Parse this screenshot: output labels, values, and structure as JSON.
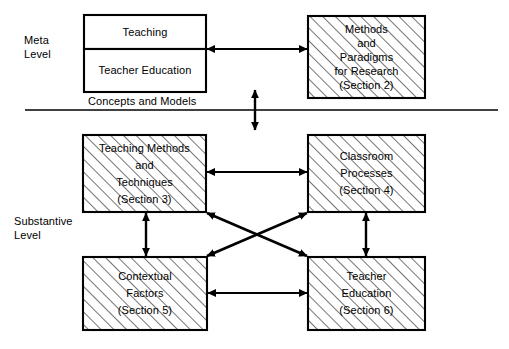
{
  "figure": {
    "levels": {
      "meta": {
        "line1": "Meta",
        "line2": "Level"
      },
      "substantive": {
        "line1": "Substantive",
        "line2": "Level"
      }
    },
    "divider_caption": "Concepts and  Models",
    "boxes": [
      {
        "id": "teaching",
        "name": "teaching-box",
        "hatched": false,
        "lines": [
          "Teaching"
        ]
      },
      {
        "id": "teacher-education-meta",
        "name": "teacher-education-meta-box",
        "hatched": false,
        "lines": [
          "Teacher  Education"
        ]
      },
      {
        "id": "methods-paradigms",
        "name": "methods-and-paradigms-box",
        "hatched": true,
        "lines": [
          "Methods",
          "and",
          "Paradigms",
          "for  Research",
          "(Section 2)"
        ]
      },
      {
        "id": "teaching-methods",
        "name": "teaching-methods-box",
        "hatched": true,
        "lines": [
          "Teaching Methods",
          "and",
          "Techniques",
          "(Section 3)"
        ]
      },
      {
        "id": "classroom-processes",
        "name": "classroom-processes-box",
        "hatched": true,
        "lines": [
          "Classroom",
          "Processes",
          "(Section 4)"
        ]
      },
      {
        "id": "contextual-factors",
        "name": "contextual-factors-box",
        "hatched": true,
        "lines": [
          "Contextual",
          "Factors",
          "(Section 5)"
        ]
      },
      {
        "id": "teacher-education-sub",
        "name": "teacher-education-substantive-box",
        "hatched": true,
        "lines": [
          "Teacher",
          "Education",
          "(Section 6)"
        ]
      }
    ],
    "connectors": [
      {
        "name": "meta-horizontal-arrow",
        "kind": "double-arrow",
        "orientation": "horizontal"
      },
      {
        "name": "level-crossing-arrow",
        "kind": "double-arrow",
        "orientation": "vertical"
      },
      {
        "name": "upper-substantive-horizontal-arrow",
        "kind": "double-arrow",
        "orientation": "horizontal"
      },
      {
        "name": "lower-substantive-horizontal-arrow",
        "kind": "double-arrow",
        "orientation": "horizontal"
      },
      {
        "name": "left-vertical-arrow",
        "kind": "double-arrow",
        "orientation": "vertical"
      },
      {
        "name": "right-vertical-arrow",
        "kind": "double-arrow",
        "orientation": "vertical"
      },
      {
        "name": "diagonal-arrow-methods-to-teacher-education",
        "kind": "double-arrow",
        "orientation": "diagonal"
      },
      {
        "name": "diagonal-arrow-contextual-to-classroom",
        "kind": "double-arrow",
        "orientation": "diagonal"
      }
    ],
    "colors": {
      "stroke": "#000000",
      "background": "#ffffff",
      "hatch": "#2b2b2b"
    }
  },
  "text": {
    "meta_level_1": "Meta",
    "meta_level_2": "Level",
    "substantive_level_1": "Substantive",
    "substantive_level_2": "Level",
    "concepts_and_models": "Concepts and  Models",
    "teaching": "Teaching",
    "teacher_education_meta": "Teacher  Education",
    "methods_l1": "Methods",
    "methods_l2": "and",
    "methods_l3": "Paradigms",
    "methods_l4": "for  Research",
    "methods_l5": "(Section 2)",
    "tm_l1": "Teaching Methods",
    "tm_l2": "and",
    "tm_l3": "Techniques",
    "tm_l4": "(Section 3)",
    "cp_l1": "Classroom",
    "cp_l2": "Processes",
    "cp_l3": "(Section 4)",
    "cf_l1": "Contextual",
    "cf_l2": "Factors",
    "cf_l3": "(Section 5)",
    "te_l1": "Teacher",
    "te_l2": "Education",
    "te_l3": "(Section 6)"
  }
}
